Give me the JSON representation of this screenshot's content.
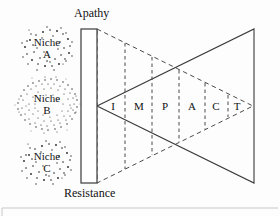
{
  "figure": {
    "top_label": "Apathy",
    "bottom_label": "Resistance",
    "barrier_name": "resistance-barrier"
  },
  "niches": [
    {
      "id": "A",
      "line1": "Niche",
      "line2": "A",
      "density": "sparse"
    },
    {
      "id": "B",
      "line1": "Niche",
      "line2": "B",
      "density": "dense"
    },
    {
      "id": "C",
      "line1": "Niche",
      "line2": "C",
      "density": "sparse"
    }
  ],
  "impact": {
    "word": "IMPACT",
    "letters": [
      {
        "label": "I",
        "x": 113
      },
      {
        "label": "M",
        "x": 139
      },
      {
        "label": "P",
        "x": 165
      },
      {
        "label": "A",
        "x": 192
      },
      {
        "label": "C",
        "x": 216
      },
      {
        "label": "T",
        "x": 237
      }
    ]
  },
  "colors": {
    "line": "#3a3a3a",
    "dash": "#4a4a4a",
    "background": "#fdfdfd",
    "text": "#111111",
    "frame": "#c8c8c8"
  }
}
